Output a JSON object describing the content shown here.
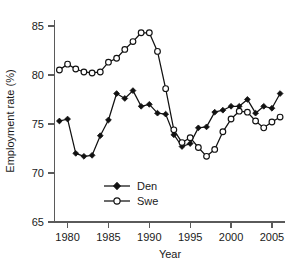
{
  "chart_data": {
    "type": "line",
    "title": "",
    "xlabel": "Year",
    "ylabel": "Employment rate (%)",
    "xlim": [
      1978.4,
      2006.6
    ],
    "ylim": [
      65,
      85.6
    ],
    "xticks": [
      1980,
      1985,
      1990,
      1995,
      2000,
      2005
    ],
    "xticklabels": [
      "1980",
      "1985",
      "1990",
      "1995",
      "2000",
      "2005"
    ],
    "yticks": [
      65,
      70,
      75,
      80,
      85
    ],
    "yticklabels": [
      "65",
      "70",
      "75",
      "80",
      "85"
    ],
    "grid": false,
    "legend_position": "lower-center",
    "series": [
      {
        "name": "Den",
        "marker": "filled-diamond",
        "color": "#111111",
        "x": [
          1979,
          1980,
          1981,
          1982,
          1983,
          1984,
          1985,
          1986,
          1987,
          1988,
          1989,
          1990,
          1991,
          1992,
          1993,
          1994,
          1995,
          1996,
          1997,
          1998,
          1999,
          2000,
          2001,
          2002,
          2003,
          2004,
          2005,
          2006
        ],
        "values": [
          75.3,
          75.5,
          72.0,
          71.7,
          71.8,
          73.8,
          75.4,
          78.1,
          77.6,
          78.4,
          76.8,
          77.0,
          76.1,
          76.0,
          73.9,
          72.7,
          73.0,
          74.6,
          74.7,
          76.2,
          76.4,
          76.8,
          76.8,
          77.5,
          76.1,
          76.8,
          76.6,
          78.1
        ]
      },
      {
        "name": "Swe",
        "marker": "open-circle",
        "color": "#111111",
        "x": [
          1979,
          1980,
          1981,
          1982,
          1983,
          1984,
          1985,
          1986,
          1987,
          1988,
          1989,
          1990,
          1991,
          1992,
          1993,
          1994,
          1995,
          1996,
          1997,
          1998,
          1999,
          2000,
          2001,
          2002,
          2003,
          2004,
          2005,
          2006
        ],
        "values": [
          80.5,
          81.1,
          80.6,
          80.3,
          80.2,
          80.3,
          81.3,
          81.7,
          82.6,
          83.4,
          84.3,
          84.3,
          82.4,
          78.6,
          74.4,
          73.1,
          73.6,
          72.6,
          71.7,
          72.4,
          74.2,
          75.5,
          76.3,
          76.2,
          75.3,
          74.6,
          75.2,
          75.7
        ]
      }
    ]
  },
  "legend": {
    "entries": [
      {
        "label": "Den"
      },
      {
        "label": "Swe"
      }
    ]
  }
}
